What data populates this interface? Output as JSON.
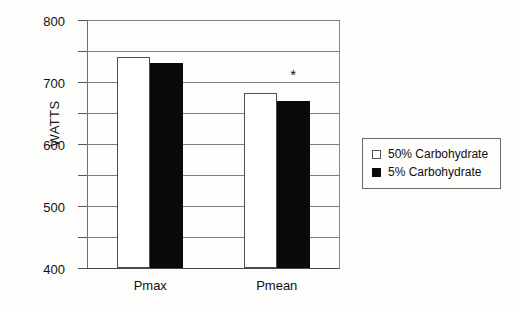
{
  "chart_data": {
    "type": "bar",
    "title": "",
    "xlabel": "",
    "ylabel": "WATTS",
    "categories": [
      "Pmax",
      "Pmean"
    ],
    "series": [
      {
        "name": "50% Carbohydrate",
        "color": "#ffffff",
        "values": [
          680,
          565
        ]
      },
      {
        "name": "5% Carbohydrate",
        "color": "#0a0a0a",
        "values": [
          660,
          540
        ]
      }
    ],
    "ylim": [
      0,
      800
    ],
    "ytick_step": 100,
    "yticks": [
      800,
      700,
      600,
      500,
      400,
      300,
      200,
      100,
      0
    ],
    "ytick_labels": [
      "800",
      "700",
      "600",
      "500",
      "400",
      "300",
      "200",
      "100",
      "0"
    ],
    "grid": true,
    "legend_position": "right-outside",
    "annotations": [
      {
        "text": "*",
        "category": "Pmean",
        "series": "5% Carbohydrate",
        "value": 600
      }
    ]
  },
  "legend": {
    "items": [
      {
        "label": "50% Carbohydrate",
        "swatch": "light"
      },
      {
        "label": "5% Carbohydrate",
        "swatch": "dark"
      }
    ]
  }
}
